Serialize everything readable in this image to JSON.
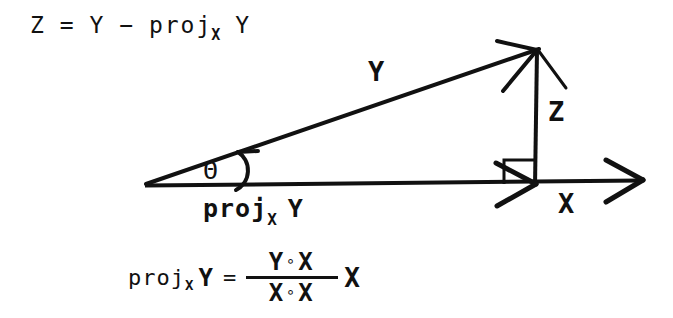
{
  "figure": {
    "background_color": "#ffffff",
    "ink_color": "#111111",
    "width": 673,
    "height": 318
  },
  "equation_top": {
    "lhs": "Z",
    "equals": "=",
    "term1": "Y",
    "minus": "−",
    "proj": "proj",
    "subscript": "X",
    "term2": "Y",
    "full_text": "Z = Y − proj_X Y"
  },
  "labels": {
    "vector_y": "Y",
    "vector_z": "Z",
    "vector_x": "X",
    "angle_theta": "Θ",
    "projection": {
      "proj": "proj",
      "subscript": "X",
      "operand": "Y",
      "full_text": "proj_X Y"
    }
  },
  "equation_bottom": {
    "proj": "proj",
    "subscript": "X",
    "operand": "Y",
    "equals": "=",
    "numerator": {
      "left": "Y",
      "operator": "∘",
      "right": "X",
      "text": "Y ∘ X"
    },
    "denominator": {
      "left": "X",
      "operator": "∘",
      "right": "X",
      "text": "X ∘ X"
    },
    "multiplier": "X",
    "full_text": "proj_X Y = (Y ∘ X)/(X ∘ X) X"
  },
  "geometry": {
    "origin": {
      "x": 145,
      "y": 185
    },
    "y_vector_tip": {
      "x": 540,
      "y": 48
    },
    "projection_foot": {
      "x": 535,
      "y": 184
    },
    "x_axis_end": {
      "x": 645,
      "y": 180
    },
    "right_angle_marker": true,
    "angle_arc": true,
    "arrowheads": [
      "y-vector",
      "x-projection",
      "x-axis"
    ]
  }
}
